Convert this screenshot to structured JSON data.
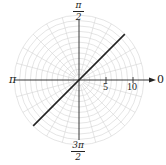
{
  "chart_data": {
    "type": "line",
    "coordinate_system": "polar",
    "title": "",
    "equation": "theta = pi/4",
    "series": [
      {
        "name": "theta = pi/4",
        "points": [
          {
            "r": 12,
            "theta_deg": 45
          },
          {
            "r": -12,
            "theta_deg": 45
          }
        ],
        "color": "#222222"
      }
    ],
    "radial_ticks": [
      5,
      10
    ],
    "rlim": [
      0,
      12
    ],
    "grid": {
      "on": true,
      "circle_step": 1,
      "circle_count": 12,
      "radial_step_deg": 15,
      "color": "#d4d4d4"
    },
    "angle_labels": {
      "zero": "0",
      "half_pi": {
        "num": "π",
        "den": "2"
      },
      "pi": "π",
      "three_half_pi": {
        "num": "3π",
        "den": "2"
      }
    },
    "axis_color": "#222222"
  }
}
